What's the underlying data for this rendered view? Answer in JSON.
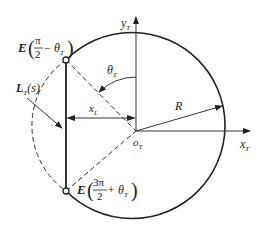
{
  "diagram": {
    "type": "geometric-construction",
    "colors": {
      "stroke": "#222222",
      "background": "#ffffff"
    },
    "axes": {
      "y_label": "y",
      "y_sub": "T",
      "x_label": "x",
      "x_sub": "T",
      "origin_label": "o",
      "origin_sub": "T"
    },
    "circle": {
      "radius_label": "R"
    },
    "angle": {
      "label": "θ",
      "sub": "T"
    },
    "distance": {
      "label": "x",
      "sub": "L"
    },
    "line_label": {
      "main": "L",
      "sub": "T",
      "arg": "(s)"
    },
    "points": [
      {
        "name": "E",
        "num": "π",
        "den": "2",
        "rest": " − θ",
        "sub": "T"
      },
      {
        "name": "E",
        "num": "3π",
        "den": "2",
        "rest": " + θ",
        "sub": "T"
      }
    ]
  }
}
